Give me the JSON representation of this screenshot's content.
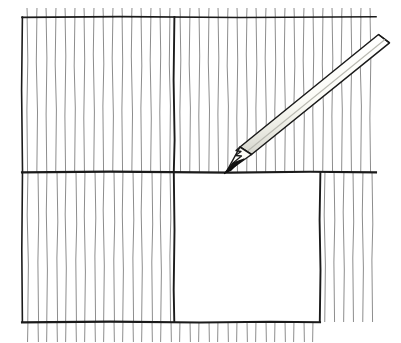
{
  "figure": {
    "title": "Pencil ruling a line across vertically hatched paper",
    "medium": "pen-and-ink line drawing",
    "canvas": {
      "width": 401,
      "height": 343,
      "background_color": "#ffffff"
    },
    "palette": {
      "paper": "#ffffff",
      "ink_dark": "#141414",
      "ink_border": "#222222",
      "hatch_light": "#9a9a9a",
      "hatch_mid": "#6e6e6e",
      "pencil_body_fill": "#fbfbf7",
      "pencil_outline": "#1a1a1a",
      "pencil_shadow": "#cfcfc9",
      "graphite_tip": "#101010"
    }
  },
  "frame": {
    "label": "outer sheet frame",
    "top_rule": {
      "x1": 22,
      "y1": 17,
      "x2": 376,
      "y2": 17
    },
    "left_rule": {
      "x1": 22,
      "y1": 17,
      "x2": 22,
      "y2": 322
    },
    "mid_horizontal_rule": {
      "x1": 22,
      "y1": 172,
      "x2": 376,
      "y2": 172
    },
    "mid_vertical_rule": {
      "x1": 174,
      "y1": 17,
      "x2": 174,
      "y2": 322
    },
    "right_inner_rule": {
      "x1": 320,
      "y1": 172,
      "x2": 320,
      "y2": 322
    },
    "bottom_rule": {
      "x1": 22,
      "y1": 322,
      "x2": 320,
      "y2": 322
    }
  },
  "panels": [
    {
      "name": "top-left-panel",
      "hatched": true,
      "x": 22,
      "y": 17,
      "width": 152,
      "height": 155
    },
    {
      "name": "top-right-panel",
      "hatched": true,
      "x": 174,
      "y": 17,
      "width": 202,
      "height": 155
    },
    {
      "name": "bottom-left-panel",
      "hatched": true,
      "x": 22,
      "y": 172,
      "width": 152,
      "height": 150
    },
    {
      "name": "bottom-right-panel",
      "hatched": false,
      "x": 174,
      "y": 172,
      "width": 146,
      "height": 150
    },
    {
      "name": "right-margin-strip",
      "hatched": true,
      "x": 320,
      "y": 172,
      "width": 56,
      "height": 150
    },
    {
      "name": "bottom-margin-strip",
      "hatched": true,
      "x": 22,
      "y": 322,
      "width": 354,
      "height": 18
    }
  ],
  "hatching": {
    "label": "vertical hatch strokes",
    "orientation": "vertical",
    "nominal_spacing_px": 10,
    "stroke_width_px": 1,
    "color": "#8d8d8d",
    "count_top_band": 35,
    "count_bottom_band": 30,
    "wobble": "hand-drawn, slight horizontal jitter per stroke"
  },
  "pencil": {
    "label": "pencil",
    "state": "drawing",
    "tip_point": {
      "x": 224,
      "y": 173
    },
    "butt_end": {
      "x": 389,
      "y": 44
    },
    "angle_degrees": -38,
    "length_px": 209,
    "barrel_width_px": 17,
    "tip_type": "sharpened graphite point",
    "end_type": "flat cut end",
    "body_fill": "#fbfbf7",
    "outline_color": "#1a1a1a"
  },
  "annotations": {
    "note": "No text labels appear in the illustration."
  }
}
